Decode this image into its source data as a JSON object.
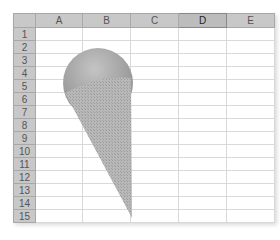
{
  "spreadsheet": {
    "columns": [
      {
        "label": "A",
        "active": false
      },
      {
        "label": "B",
        "active": false
      },
      {
        "label": "C",
        "active": false
      },
      {
        "label": "D",
        "active": true
      },
      {
        "label": "E",
        "active": false
      }
    ],
    "rows": [
      "1",
      "2",
      "3",
      "4",
      "5",
      "6",
      "7",
      "8",
      "9",
      "10",
      "11",
      "12",
      "13",
      "14",
      "15"
    ]
  },
  "shape": {
    "type": "ice-cream-cone",
    "scoop_color": "#a8a8a8",
    "cone_color": "#b4b4b4"
  }
}
